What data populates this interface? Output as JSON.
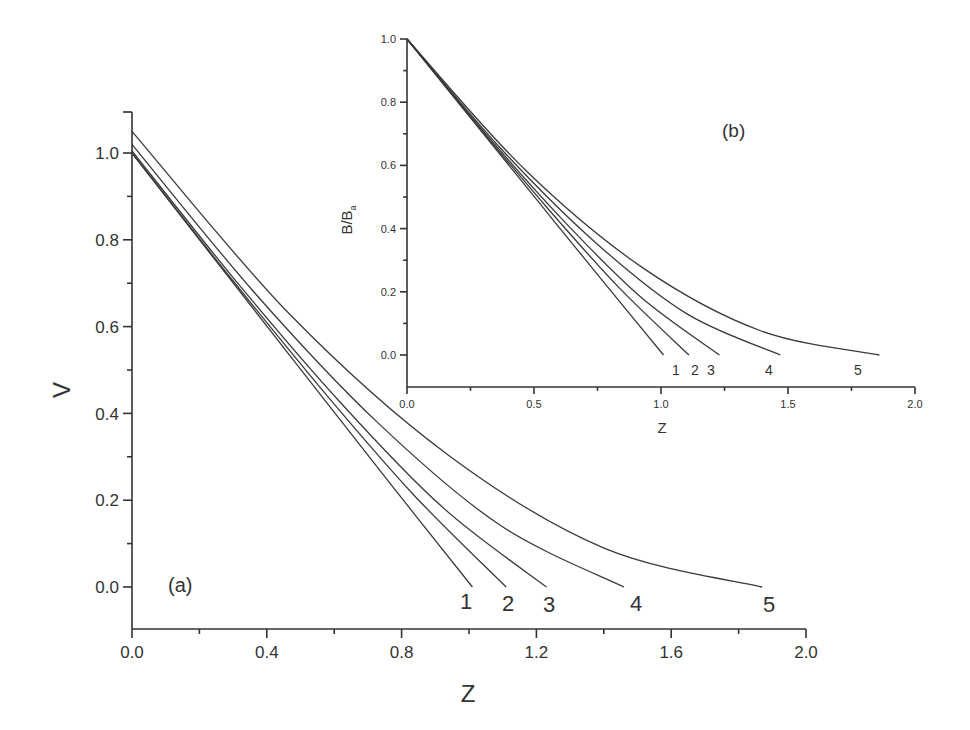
{
  "chart_data": [
    {
      "id": "a",
      "type": "line",
      "panel_label": "(a)",
      "title": "",
      "xlabel": "Z",
      "ylabel": "V",
      "xlim": [
        0.0,
        2.0
      ],
      "ylim": [
        -0.1,
        1.1
      ],
      "xticks": [
        "0.0",
        "0.4",
        "0.8",
        "1.2",
        "1.6",
        "2.0"
      ],
      "xtick_values": [
        0.0,
        0.4,
        0.8,
        1.2,
        1.6,
        2.0
      ],
      "yticks": [
        "0.0",
        "0.2",
        "0.4",
        "0.6",
        "0.8",
        "1.0"
      ],
      "ytick_values": [
        0.0,
        0.2,
        0.4,
        0.6,
        0.8,
        1.0
      ],
      "grid": false,
      "legend": "curve-end labels 1-5",
      "series": [
        {
          "name": "1",
          "x": [
            0.0,
            0.2525,
            0.505,
            0.7575,
            1.01
          ],
          "y": [
            1.0,
            0.748,
            0.497,
            0.247,
            0.0
          ]
        },
        {
          "name": "2",
          "x": [
            0.0,
            0.2775,
            0.555,
            0.8325,
            1.11
          ],
          "y": [
            1.0,
            0.727,
            0.463,
            0.215,
            0.0
          ]
        },
        {
          "name": "3",
          "x": [
            0.0,
            0.3075,
            0.615,
            0.9225,
            1.23
          ],
          "y": [
            1.005,
            0.706,
            0.428,
            0.183,
            0.0
          ]
        },
        {
          "name": "4",
          "x": [
            0.0,
            0.365,
            0.73,
            1.095,
            1.46
          ],
          "y": [
            1.02,
            0.677,
            0.378,
            0.141,
            0.0
          ]
        },
        {
          "name": "5",
          "x": [
            0.0,
            0.4675,
            0.935,
            1.4025,
            1.87
          ],
          "y": [
            1.05,
            0.629,
            0.306,
            0.089,
            0.0
          ]
        }
      ]
    },
    {
      "id": "b",
      "type": "line",
      "panel_label": "(b)",
      "title": "",
      "xlabel": "Z",
      "ylabel": "B/B",
      "ylabel_subscript": "a",
      "xlim": [
        0.0,
        2.0
      ],
      "ylim": [
        -0.1,
        1.0
      ],
      "xticks": [
        "0.0",
        "0.5",
        "1.0",
        "1.5",
        "2.0"
      ],
      "xtick_values": [
        0.0,
        0.5,
        1.0,
        1.5,
        2.0
      ],
      "yticks": [
        "0.0",
        "0.2",
        "0.4",
        "0.6",
        "0.8",
        "1.0"
      ],
      "ytick_values": [
        0.0,
        0.2,
        0.4,
        0.6,
        0.8,
        1.0
      ],
      "grid": false,
      "legend": "curve-end labels 1-5",
      "series": [
        {
          "name": "1",
          "x": [
            0.0,
            0.2525,
            0.505,
            0.7575,
            1.01
          ],
          "y": [
            1.0,
            0.748,
            0.497,
            0.247,
            0.0
          ]
        },
        {
          "name": "2",
          "x": [
            0.0,
            0.2775,
            0.555,
            0.8325,
            1.11
          ],
          "y": [
            1.0,
            0.727,
            0.463,
            0.215,
            0.0
          ]
        },
        {
          "name": "3",
          "x": [
            0.0,
            0.3075,
            0.615,
            0.9225,
            1.23
          ],
          "y": [
            1.0,
            0.702,
            0.426,
            0.182,
            0.0
          ]
        },
        {
          "name": "4",
          "x": [
            0.0,
            0.3675,
            0.735,
            1.1025,
            1.47
          ],
          "y": [
            1.0,
            0.655,
            0.361,
            0.13,
            0.0
          ]
        },
        {
          "name": "5",
          "x": [
            0.0,
            0.465,
            0.93,
            1.395,
            1.86
          ],
          "y": [
            1.0,
            0.586,
            0.275,
            0.076,
            0.0
          ]
        }
      ]
    }
  ],
  "layout": {
    "a": {
      "x0": 132,
      "x1": 806,
      "y0": 587,
      "y1": 153,
      "axis_bottom": 629,
      "axis_top": 112,
      "font": 17,
      "label_font": 24,
      "curve_label_font": 22,
      "curve_label_pos": [
        [
          466,
          609
        ],
        [
          508,
          611
        ],
        [
          549,
          612
        ],
        [
          636,
          611
        ],
        [
          769,
          612
        ]
      ],
      "panel_label_pos": [
        168,
        592
      ],
      "xlabel_pos": [
        468,
        702
      ],
      "ylabel_pos": [
        70,
        390
      ]
    },
    "b": {
      "x0": 407,
      "x1": 915,
      "y0": 355,
      "y1": 39,
      "axis_bottom": 387,
      "font": 11,
      "label_font": 15,
      "curve_label_font": 14,
      "curve_label_pos": [
        [
          676,
          375
        ],
        [
          695,
          375
        ],
        [
          711,
          375
        ],
        [
          769,
          375
        ],
        [
          858,
          375
        ]
      ],
      "panel_label_pos": [
        722,
        137
      ],
      "xlabel_pos": [
        662,
        433
      ],
      "ylabel_pos": [
        352,
        220
      ]
    }
  }
}
